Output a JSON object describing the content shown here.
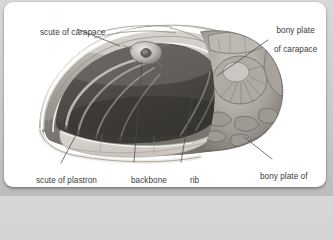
{
  "figure": {
    "style": "pencil-engraving",
    "colors": {
      "card_background": "#ffffff",
      "page_background": "#cccccc",
      "label_text": "#3b3b3b",
      "leader_line": "#4a4a4a",
      "shell_light": "#e9e7e3",
      "shell_mid": "#b7b3ad",
      "shell_dark": "#6e6a66",
      "cavity_dark": "#4a4844",
      "plastron_floor": "#d9d6d0"
    }
  },
  "labels": [
    {
      "id": "scute-of-carapace",
      "text": "scute of carapace",
      "lines": [
        "scute of carapace"
      ],
      "position": "top-left"
    },
    {
      "id": "bony-plate-of-carapace",
      "text": "bony plate of carapace",
      "lines": [
        "bony plate",
        "of carapace"
      ],
      "position": "top-right"
    },
    {
      "id": "scute-of-plastron",
      "text": "scute of plastron",
      "lines": [
        "scute of plastron"
      ],
      "position": "bottom-left"
    },
    {
      "id": "backbone",
      "text": "backbone",
      "lines": [
        "backbone"
      ],
      "position": "bottom-center-left"
    },
    {
      "id": "rib",
      "text": "rib",
      "lines": [
        "rib"
      ],
      "position": "bottom-center-right"
    },
    {
      "id": "bony-plate-of-plastron",
      "text": "bony plate of plastron",
      "lines": [
        "bony plate of",
        "plastron"
      ],
      "position": "bottom-right"
    }
  ],
  "label_text": {
    "scute_of_carapace": "scute of carapace",
    "bony_plate_of_carapace_l1": "bony plate",
    "bony_plate_of_carapace_l2": "of carapace",
    "scute_of_plastron": "scute of plastron",
    "backbone": "backbone",
    "rib": "rib",
    "bony_plate_of_plastron_l1": "bony plate of",
    "bony_plate_of_plastron_l2": "plastron"
  }
}
